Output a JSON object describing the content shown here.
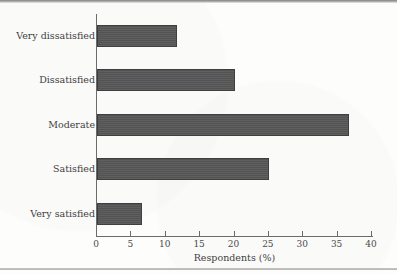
{
  "chart_data": {
    "type": "bar",
    "orientation": "horizontal",
    "title": "",
    "xlabel": "Respondents (%)",
    "ylabel": "",
    "xlim": [
      0,
      40
    ],
    "xticks": [
      0,
      5,
      10,
      15,
      20,
      25,
      30,
      35,
      40
    ],
    "xtick_labels": [
      "0",
      "5",
      "10",
      "15",
      "20",
      "25",
      "30",
      "35",
      "40"
    ],
    "grid": false,
    "legend": null,
    "categories": [
      "Very dissatisfied",
      "Dissatisfied",
      "Moderate",
      "Satisfied",
      "Very satisfied"
    ],
    "values": [
      11.6,
      20.0,
      36.6,
      25.0,
      6.5
    ],
    "bar_color": "#575757",
    "bar_edge_color": "#3f3f3f",
    "axis_color": "#6b6b6b",
    "background_color": "#fdfdfc"
  },
  "figure": {
    "axis_title": "Respondents (%)"
  }
}
